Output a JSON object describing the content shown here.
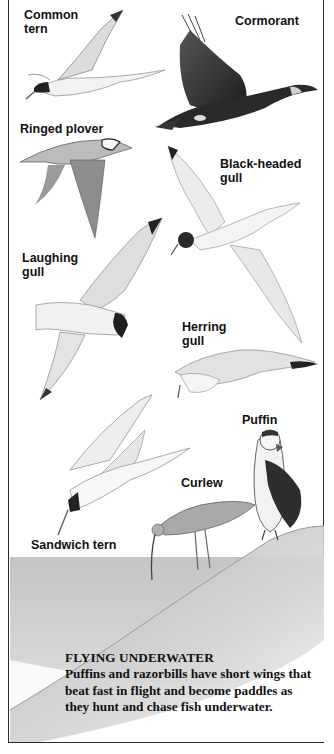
{
  "plate": {
    "border_color": "#2b2b2b",
    "water_color": "#c9c9c9",
    "hill_color": "#bdbdbd"
  },
  "labels": [
    {
      "id": "common-tern",
      "text": "Common\ntern"
    },
    {
      "id": "cormorant",
      "text": "Cormorant"
    },
    {
      "id": "ringed-plover",
      "text": "Ringed plover"
    },
    {
      "id": "black-headed-gull",
      "text": "Black-headed\ngull"
    },
    {
      "id": "laughing-gull",
      "text": "Laughing\ngull"
    },
    {
      "id": "herring-gull",
      "text": "Herring\ngull"
    },
    {
      "id": "puffin",
      "text": "Puffin"
    },
    {
      "id": "curlew",
      "text": "Curlew"
    },
    {
      "id": "sandwich-tern",
      "text": "Sandwich tern"
    }
  ],
  "caption": {
    "title": "FLYING UNDERWATER",
    "body": "Puffins and razorbills have short wings that beat fast in flight and become paddles as they hunt and chase fish underwater."
  }
}
